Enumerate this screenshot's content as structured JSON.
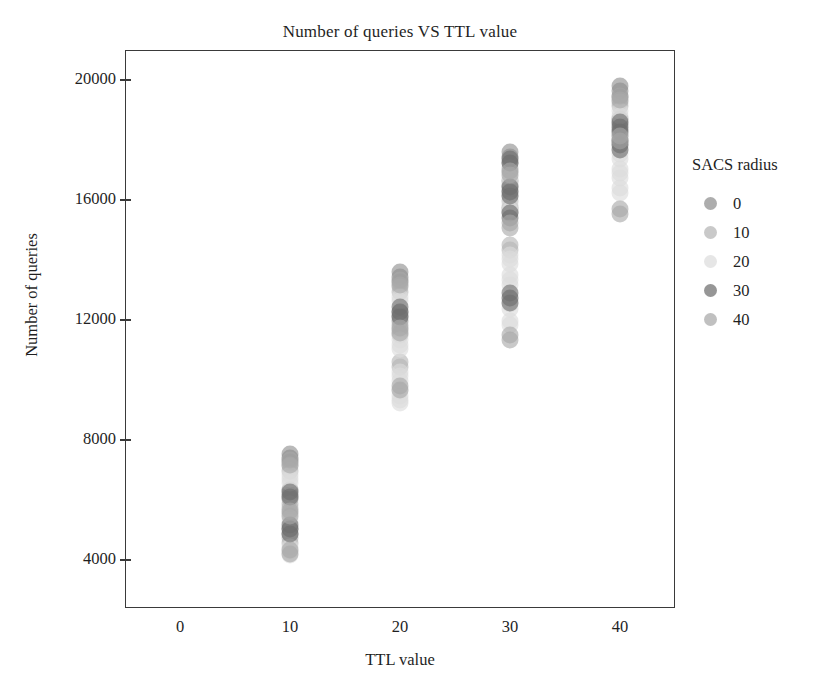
{
  "chart_data": {
    "type": "scatter",
    "title": "Number of queries VS TTL value",
    "xlabel": "TTL value",
    "ylabel": "Number of queries",
    "xlim": [
      -5,
      45
    ],
    "ylim": [
      2400,
      21000
    ],
    "xticks": [
      0,
      10,
      20,
      30,
      40
    ],
    "xticklabels": [
      "0",
      "10",
      "20",
      "30",
      "40"
    ],
    "yticks": [
      4000,
      8000,
      12000,
      16000,
      20000
    ],
    "yticklabels": [
      "4000",
      "8000",
      "12000",
      "16000",
      "20000"
    ],
    "grid": false,
    "legend": {
      "title": "SACS radius",
      "position": "right",
      "entries": [
        {
          "label": "0",
          "color": "#8e8e8e"
        },
        {
          "label": "10",
          "color": "#b4b4b4"
        },
        {
          "label": "20",
          "color": "#dcdcdc"
        },
        {
          "label": "30",
          "color": "#6e6e6e"
        },
        {
          "label": "40",
          "color": "#a8a8a8"
        }
      ]
    },
    "series": [
      {
        "name": "0",
        "color": "#8e8e8e",
        "points": [
          {
            "x": 10,
            "y": 7550
          },
          {
            "x": 10,
            "y": 7400
          },
          {
            "x": 10,
            "y": 7280
          },
          {
            "x": 10,
            "y": 6350
          },
          {
            "x": 10,
            "y": 6180
          },
          {
            "x": 10,
            "y": 6020
          },
          {
            "x": 10,
            "y": 5050
          },
          {
            "x": 10,
            "y": 4880
          },
          {
            "x": 20,
            "y": 13600
          },
          {
            "x": 20,
            "y": 13420
          },
          {
            "x": 20,
            "y": 13260
          },
          {
            "x": 20,
            "y": 12280
          },
          {
            "x": 20,
            "y": 12120
          },
          {
            "x": 20,
            "y": 11980
          },
          {
            "x": 30,
            "y": 17600
          },
          {
            "x": 30,
            "y": 17420
          },
          {
            "x": 30,
            "y": 17240
          },
          {
            "x": 30,
            "y": 16650
          },
          {
            "x": 30,
            "y": 16480
          },
          {
            "x": 30,
            "y": 16300
          },
          {
            "x": 30,
            "y": 15750
          },
          {
            "x": 30,
            "y": 15600
          },
          {
            "x": 40,
            "y": 19800
          },
          {
            "x": 40,
            "y": 19620
          },
          {
            "x": 40,
            "y": 19450
          },
          {
            "x": 40,
            "y": 18700
          },
          {
            "x": 40,
            "y": 18520
          },
          {
            "x": 40,
            "y": 18350
          }
        ]
      },
      {
        "name": "10",
        "color": "#b4b4b4",
        "points": [
          {
            "x": 10,
            "y": 7120
          },
          {
            "x": 10,
            "y": 6980
          },
          {
            "x": 10,
            "y": 5880
          },
          {
            "x": 10,
            "y": 5720
          },
          {
            "x": 10,
            "y": 5560
          },
          {
            "x": 10,
            "y": 4720
          },
          {
            "x": 10,
            "y": 4580
          },
          {
            "x": 20,
            "y": 13100
          },
          {
            "x": 20,
            "y": 12940
          },
          {
            "x": 20,
            "y": 11820
          },
          {
            "x": 20,
            "y": 11660
          },
          {
            "x": 20,
            "y": 11500
          },
          {
            "x": 20,
            "y": 10600
          },
          {
            "x": 20,
            "y": 10440
          },
          {
            "x": 30,
            "y": 17080
          },
          {
            "x": 30,
            "y": 16920
          },
          {
            "x": 30,
            "y": 16150
          },
          {
            "x": 30,
            "y": 15980
          },
          {
            "x": 30,
            "y": 14500
          },
          {
            "x": 30,
            "y": 14340
          },
          {
            "x": 40,
            "y": 19280
          },
          {
            "x": 40,
            "y": 19120
          },
          {
            "x": 40,
            "y": 18180
          },
          {
            "x": 40,
            "y": 18020
          },
          {
            "x": 40,
            "y": 17860
          }
        ]
      },
      {
        "name": "20",
        "color": "#dcdcdc",
        "points": [
          {
            "x": 10,
            "y": 6840
          },
          {
            "x": 10,
            "y": 6700
          },
          {
            "x": 10,
            "y": 6560
          },
          {
            "x": 10,
            "y": 5400
          },
          {
            "x": 10,
            "y": 5260
          },
          {
            "x": 10,
            "y": 4440
          },
          {
            "x": 10,
            "y": 4300
          },
          {
            "x": 10,
            "y": 4160
          },
          {
            "x": 20,
            "y": 12780
          },
          {
            "x": 20,
            "y": 12620
          },
          {
            "x": 20,
            "y": 11340
          },
          {
            "x": 20,
            "y": 11180
          },
          {
            "x": 20,
            "y": 11020
          },
          {
            "x": 20,
            "y": 10280
          },
          {
            "x": 20,
            "y": 10120
          },
          {
            "x": 20,
            "y": 9960
          },
          {
            "x": 20,
            "y": 9640
          },
          {
            "x": 20,
            "y": 9480
          },
          {
            "x": 20,
            "y": 9320
          },
          {
            "x": 20,
            "y": 9220
          },
          {
            "x": 30,
            "y": 16760
          },
          {
            "x": 30,
            "y": 16600
          },
          {
            "x": 30,
            "y": 15820
          },
          {
            "x": 30,
            "y": 15660
          },
          {
            "x": 30,
            "y": 14180
          },
          {
            "x": 30,
            "y": 14020
          },
          {
            "x": 30,
            "y": 13860
          },
          {
            "x": 30,
            "y": 13500
          },
          {
            "x": 30,
            "y": 13340
          },
          {
            "x": 30,
            "y": 13180
          },
          {
            "x": 30,
            "y": 12700
          },
          {
            "x": 30,
            "y": 12540
          },
          {
            "x": 30,
            "y": 12380
          },
          {
            "x": 30,
            "y": 11980
          },
          {
            "x": 30,
            "y": 11820
          },
          {
            "x": 40,
            "y": 18960
          },
          {
            "x": 40,
            "y": 18800
          },
          {
            "x": 40,
            "y": 17700
          },
          {
            "x": 40,
            "y": 17540
          },
          {
            "x": 40,
            "y": 17380
          },
          {
            "x": 40,
            "y": 17050
          },
          {
            "x": 40,
            "y": 16890
          },
          {
            "x": 40,
            "y": 16730
          },
          {
            "x": 40,
            "y": 16400
          },
          {
            "x": 40,
            "y": 16250
          }
        ]
      },
      {
        "name": "30",
        "color": "#6e6e6e",
        "points": [
          {
            "x": 10,
            "y": 6260
          },
          {
            "x": 10,
            "y": 6100
          },
          {
            "x": 10,
            "y": 5180
          },
          {
            "x": 10,
            "y": 5020
          },
          {
            "x": 10,
            "y": 4860
          },
          {
            "x": 20,
            "y": 12420
          },
          {
            "x": 20,
            "y": 12260
          },
          {
            "x": 20,
            "y": 12100
          },
          {
            "x": 30,
            "y": 17380
          },
          {
            "x": 30,
            "y": 17220
          },
          {
            "x": 30,
            "y": 16440
          },
          {
            "x": 30,
            "y": 16280
          },
          {
            "x": 30,
            "y": 16120
          },
          {
            "x": 30,
            "y": 15560
          },
          {
            "x": 30,
            "y": 15400
          },
          {
            "x": 30,
            "y": 12900
          },
          {
            "x": 30,
            "y": 12740
          },
          {
            "x": 30,
            "y": 12580
          },
          {
            "x": 40,
            "y": 18600
          },
          {
            "x": 40,
            "y": 18440
          },
          {
            "x": 40,
            "y": 18280
          },
          {
            "x": 40,
            "y": 17980
          },
          {
            "x": 40,
            "y": 17820
          },
          {
            "x": 40,
            "y": 17660
          }
        ]
      },
      {
        "name": "40",
        "color": "#a8a8a8",
        "points": [
          {
            "x": 10,
            "y": 7320
          },
          {
            "x": 10,
            "y": 7180
          },
          {
            "x": 10,
            "y": 5640
          },
          {
            "x": 10,
            "y": 5480
          },
          {
            "x": 10,
            "y": 4340
          },
          {
            "x": 10,
            "y": 4200
          },
          {
            "x": 20,
            "y": 13340
          },
          {
            "x": 20,
            "y": 13180
          },
          {
            "x": 20,
            "y": 11740
          },
          {
            "x": 20,
            "y": 11580
          },
          {
            "x": 20,
            "y": 9800
          },
          {
            "x": 20,
            "y": 9660
          },
          {
            "x": 30,
            "y": 16980
          },
          {
            "x": 30,
            "y": 16820
          },
          {
            "x": 30,
            "y": 15240
          },
          {
            "x": 30,
            "y": 15080
          },
          {
            "x": 30,
            "y": 11500
          },
          {
            "x": 30,
            "y": 11340
          },
          {
            "x": 40,
            "y": 19480
          },
          {
            "x": 40,
            "y": 19320
          },
          {
            "x": 40,
            "y": 18120
          },
          {
            "x": 40,
            "y": 17960
          },
          {
            "x": 40,
            "y": 15700
          },
          {
            "x": 40,
            "y": 15540
          }
        ]
      }
    ]
  }
}
